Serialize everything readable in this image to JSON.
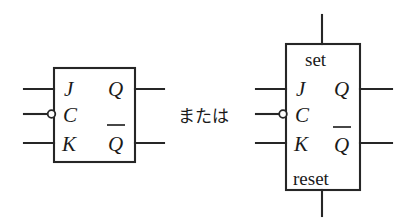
{
  "figure": {
    "background_color": "#ffffff",
    "line_color": "#262626",
    "text_color": "#1a1a1a",
    "connector_text": "または",
    "symbols": [
      {
        "id": "jk-plain",
        "name": "JK flip-flop symbol (without set/reset)",
        "inputs": [
          {
            "id": "j",
            "label": "J",
            "inverted": false
          },
          {
            "id": "c",
            "label": "C",
            "inverted": true
          },
          {
            "id": "k",
            "label": "K",
            "inverted": false
          }
        ],
        "outputs": [
          {
            "id": "q",
            "label": "Q",
            "complement": false
          },
          {
            "id": "qbar",
            "label": "Q",
            "complement": true
          }
        ]
      },
      {
        "id": "jk-set-reset",
        "name": "JK flip-flop symbol (with set and reset)",
        "top_label": "set",
        "bottom_label": "reset",
        "inputs": [
          {
            "id": "j",
            "label": "J",
            "inverted": false
          },
          {
            "id": "c",
            "label": "C",
            "inverted": true
          },
          {
            "id": "k",
            "label": "K",
            "inverted": false
          }
        ],
        "outputs": [
          {
            "id": "q",
            "label": "Q",
            "complement": false
          },
          {
            "id": "qbar",
            "label": "Q",
            "complement": true
          }
        ]
      }
    ]
  }
}
